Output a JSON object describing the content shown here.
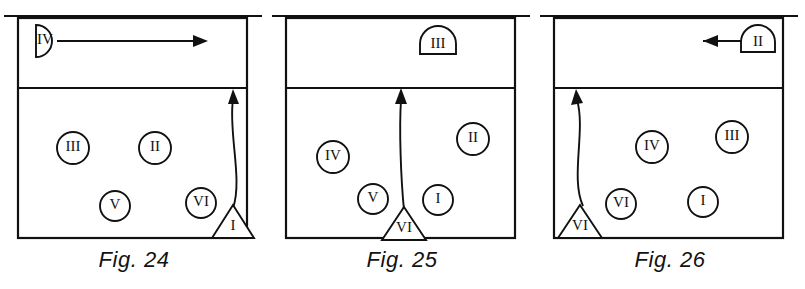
{
  "figures": [
    {
      "id": "fig-24",
      "caption": "Fig. 24",
      "court": {
        "net_label": "net-line",
        "attack_line_label": "attack-line",
        "boundary_label": "court-boundary"
      },
      "markers": [
        {
          "name": "marker-iv-halfcircle-left",
          "label": "IV",
          "shape": "half-circle-right",
          "zone": "front-court",
          "x": 45,
          "y": 41
        },
        {
          "name": "marker-iii-circle",
          "label": "III",
          "shape": "circle",
          "zone": "back-court",
          "x": 73,
          "y": 148
        },
        {
          "name": "marker-ii-circle",
          "label": "II",
          "shape": "circle",
          "zone": "back-court",
          "x": 155,
          "y": 148
        },
        {
          "name": "marker-v-circle",
          "label": "V",
          "shape": "circle",
          "zone": "back-court",
          "x": 115,
          "y": 206
        },
        {
          "name": "marker-vi-circle",
          "label": "VI",
          "shape": "circle",
          "zone": "back-court",
          "x": 201,
          "y": 203
        },
        {
          "name": "marker-i-triangle",
          "label": "I",
          "shape": "triangle",
          "zone": "back-court-corner",
          "x": 233,
          "y": 224
        }
      ],
      "arrows": [
        {
          "name": "arrow-horizontal-right",
          "kind": "straight",
          "direction": "right",
          "from": "IV",
          "to": "net-right"
        },
        {
          "name": "arrow-curved-up-right",
          "kind": "curved",
          "direction": "up",
          "from": "I",
          "to": "attack-line"
        }
      ]
    },
    {
      "id": "fig-25",
      "caption": "Fig. 25",
      "court": {
        "net_label": "net-line",
        "attack_line_label": "attack-line",
        "boundary_label": "court-boundary"
      },
      "markers": [
        {
          "name": "marker-iii-dome-top",
          "label": "III",
          "shape": "dome",
          "zone": "front-court",
          "x": 170,
          "y": 44
        },
        {
          "name": "marker-iv-circle",
          "label": "IV",
          "shape": "circle",
          "zone": "back-court",
          "x": 65,
          "y": 157
        },
        {
          "name": "marker-ii-circle",
          "label": "II",
          "shape": "circle",
          "zone": "back-court",
          "x": 205,
          "y": 139
        },
        {
          "name": "marker-v-circle",
          "label": "V",
          "shape": "circle",
          "zone": "back-court",
          "x": 105,
          "y": 199
        },
        {
          "name": "marker-i-circle",
          "label": "I",
          "shape": "circle",
          "zone": "back-court",
          "x": 170,
          "y": 200
        },
        {
          "name": "marker-vi-triangle",
          "label": "VI",
          "shape": "triangle",
          "zone": "baseline-center",
          "x": 136,
          "y": 226
        }
      ],
      "arrows": [
        {
          "name": "arrow-straight-up",
          "kind": "straight",
          "direction": "up",
          "from": "VI",
          "to": "attack-line"
        }
      ]
    },
    {
      "id": "fig-26",
      "caption": "Fig. 26",
      "court": {
        "net_label": "net-line",
        "attack_line_label": "attack-line",
        "boundary_label": "court-boundary"
      },
      "markers": [
        {
          "name": "marker-ii-dome-top-right",
          "label": "II",
          "shape": "dome",
          "zone": "front-court",
          "x": 222,
          "y": 41
        },
        {
          "name": "marker-iv-circle",
          "label": "IV",
          "shape": "circle",
          "zone": "back-court",
          "x": 116,
          "y": 147
        },
        {
          "name": "marker-iii-circle",
          "label": "III",
          "shape": "circle",
          "zone": "back-court",
          "x": 196,
          "y": 137
        },
        {
          "name": "marker-vi-circle",
          "label": "VI",
          "shape": "circle",
          "zone": "back-court",
          "x": 85,
          "y": 204
        },
        {
          "name": "marker-i-circle",
          "label": "I",
          "shape": "circle",
          "zone": "back-court",
          "x": 167,
          "y": 202
        },
        {
          "name": "marker-vi-triangle-corner",
          "label": "VI",
          "shape": "triangle",
          "zone": "back-court-corner",
          "x": 44,
          "y": 224
        }
      ],
      "arrows": [
        {
          "name": "arrow-horizontal-left",
          "kind": "straight",
          "direction": "left",
          "from": "II",
          "to": "net-left"
        },
        {
          "name": "arrow-curved-up-left",
          "kind": "curved",
          "direction": "up",
          "from": "VI",
          "to": "attack-line"
        }
      ]
    }
  ],
  "style": {
    "ink_color": "#111111",
    "paper_color": "#ffffff"
  }
}
